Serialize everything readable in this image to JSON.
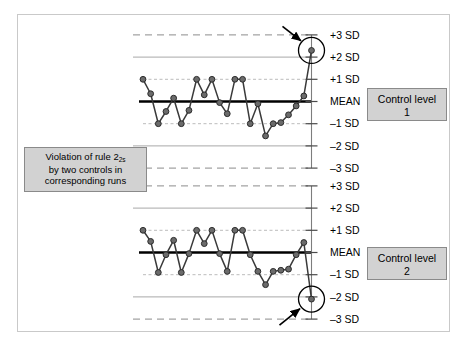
{
  "figure": {
    "background": "#ffffff",
    "frame_color": "#c9c9c9"
  },
  "annotation": {
    "line1": "Violation of rule 2",
    "subscript": "2s",
    "line2": "by two controls in",
    "line3": "corresponding runs",
    "fill": "#d2d2d2",
    "border": "#8a8a8a"
  },
  "legend": {
    "level1_line1": "Control level",
    "level1_line2": "1",
    "level2_line1": "Control level",
    "level2_line2": "2",
    "fill": "#d2d2d2",
    "border": "#8a8a8a"
  },
  "axis": {
    "labels": [
      "+3 SD",
      "+2 SD",
      "+1 SD",
      "MEAN",
      "–1 SD",
      "–2 SD",
      "–3 SD"
    ],
    "values": [
      3,
      2,
      1,
      0,
      -1,
      -2,
      -3
    ]
  },
  "colors": {
    "mean_line": "#000000",
    "sd3_line": "#8c8c8c",
    "sd2_line": "#a8a8a8",
    "sd1_line": "#b4b4b4",
    "data_line": "#3a3a3a",
    "marker_fill": "#6b6b6b",
    "marker_stroke": "#2b2b2b",
    "arrow": "#000000",
    "circle": "#000000"
  },
  "chart_data": [
    {
      "type": "line",
      "title": "Control level 1",
      "xlabel": "",
      "ylabel": "SD",
      "ylim": [
        -3,
        3
      ],
      "grid": true,
      "yticks": [
        3,
        2,
        1,
        0,
        -1,
        -2,
        -3
      ],
      "ytick_labels": [
        "+3 SD",
        "+2 SD",
        "+1 SD",
        "MEAN",
        "–1 SD",
        "–2 SD",
        "–3 SD"
      ],
      "x": [
        1,
        2,
        3,
        4,
        5,
        6,
        7,
        8,
        9,
        10,
        11,
        12,
        13,
        14,
        15,
        16,
        17,
        18,
        19,
        20,
        21,
        22,
        23,
        24,
        25,
        26
      ],
      "values": [
        1.0,
        0.35,
        -1.0,
        -0.45,
        0.15,
        -1.0,
        -0.4,
        1.0,
        0.3,
        1.0,
        -0.05,
        -0.55,
        1.0,
        1.0,
        -1.0,
        -0.1,
        -1.55,
        -1.0,
        -0.95,
        -0.6,
        -0.2,
        0.25,
        2.3
      ],
      "annotation": "Last point violates rule 2-2s (above +2 SD)",
      "flagged_point_index": 22,
      "flagged_point_value": 2.3
    },
    {
      "type": "line",
      "title": "Control level 2",
      "xlabel": "",
      "ylabel": "SD",
      "ylim": [
        -3,
        3
      ],
      "grid": true,
      "yticks": [
        3,
        2,
        1,
        0,
        -1,
        -2,
        -3
      ],
      "ytick_labels": [
        "+3 SD",
        "+2 SD",
        "+1 SD",
        "MEAN",
        "–1 SD",
        "–2 SD",
        "–3 SD"
      ],
      "x": [
        1,
        2,
        3,
        4,
        5,
        6,
        7,
        8,
        9,
        10,
        11,
        12,
        13,
        14,
        15,
        16,
        17,
        18,
        19,
        20,
        21,
        22,
        23
      ],
      "values": [
        1.0,
        0.5,
        -0.9,
        -0.1,
        0.55,
        -0.9,
        -0.05,
        1.0,
        0.4,
        1.0,
        -0.05,
        -0.85,
        1.0,
        1.0,
        -0.1,
        -0.85,
        -1.45,
        -0.85,
        -0.8,
        -0.75,
        -0.1,
        0.45,
        -2.1
      ],
      "annotation": "Last point violates rule 2-2s (below –2 SD)",
      "flagged_point_index": 22,
      "flagged_point_value": -2.1
    }
  ]
}
